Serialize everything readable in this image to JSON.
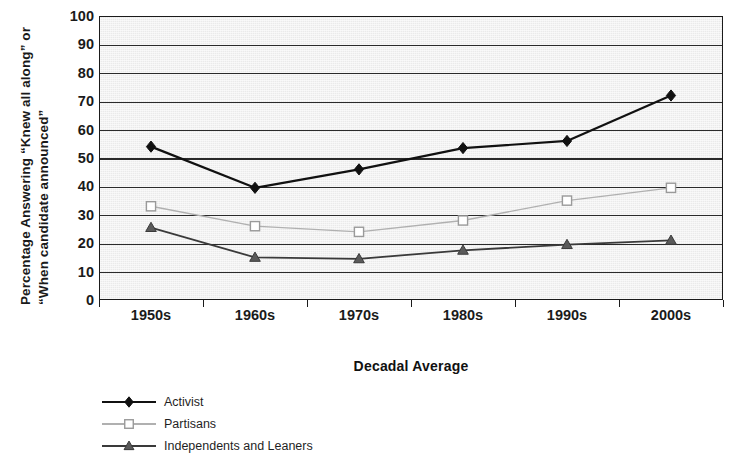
{
  "chart_data": {
    "type": "line",
    "title": "",
    "xlabel": "Decadal Average",
    "ylabel_line1": "Percentage Answering “Knew all along” or",
    "ylabel_line2": "“When candidate announced”",
    "categories": [
      "1950s",
      "1960s",
      "1970s",
      "1980s",
      "1990s",
      "2000s"
    ],
    "ylim": [
      0,
      100
    ],
    "yticks": [
      0,
      10,
      20,
      30,
      40,
      50,
      60,
      70,
      80,
      90,
      100
    ],
    "ytick_labels": [
      "0",
      "10",
      "20",
      "30",
      "40",
      "50",
      "60",
      "70",
      "80",
      "90",
      "100"
    ],
    "grid": true,
    "grid_axis": "y",
    "legend_position": "below-left",
    "series": [
      {
        "name": "Activist",
        "marker": "diamond-filled",
        "color": "#111111",
        "marker_fill": "#111111",
        "marker_stroke": "#111111",
        "line_width": 2.2,
        "values": [
          54,
          39.5,
          46,
          53.5,
          56,
          72
        ]
      },
      {
        "name": "Partisans",
        "marker": "square-open",
        "color": "#b0b0b0",
        "marker_fill": "#ffffff",
        "marker_stroke": "#9a9a9a",
        "line_width": 1.4,
        "values": [
          33,
          26,
          24,
          28,
          35,
          39.5
        ]
      },
      {
        "name": "Independents and Leaners",
        "marker": "triangle-filled",
        "color": "#3a3a3a",
        "marker_fill": "#5a5a5a",
        "marker_stroke": "#3a3a3a",
        "line_width": 1.8,
        "values": [
          25.5,
          15,
          14.5,
          17.5,
          19.5,
          21
        ]
      }
    ]
  },
  "plot": {
    "background_color": "#eaeaea",
    "frame_color": "#1b1b1b",
    "gridline_color": "#2a2a2a"
  }
}
